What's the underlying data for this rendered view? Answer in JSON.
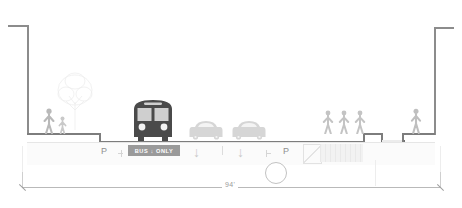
{
  "diagram": {
    "overall_dimension_label": "94'",
    "units": "feet"
  },
  "markings": {
    "parking_left_label": "P",
    "parking_right_label": "P",
    "bus_lane_label": "BUS ↓ ONLY",
    "travel_lane_arrow_1": "↓",
    "travel_lane_arrow_2": "↓"
  },
  "colors": {
    "bus_body": "#4a4a4a",
    "bus_lane_band": "#9a9a9a",
    "car_body": "#d6d6d6",
    "ground_line": "#7d7d7d",
    "building_line": "#8c8c8c",
    "figure_fill": "#bfbfbf",
    "dimension_line": "#b9b9b9",
    "background": "#ffffff"
  },
  "elements": {
    "building_left": "building-wall-left",
    "building_right": "building-wall-right",
    "sidewalk_left": "sidewalk-left",
    "sidewalk_right": "sidewalk-right",
    "parking_lane_left": "parking-lane-left",
    "bus_lane": "bus-only-lane",
    "travel_lane_1": "travel-lane-1",
    "travel_lane_2": "travel-lane-2",
    "parking_lane_right": "parking-lane-right",
    "plaza": "hatched-plaza-zone",
    "tree_pit": "sunken-tree-pit"
  },
  "figures": {
    "left_adult": "pedestrian-adult",
    "left_child": "pedestrian-child",
    "right_group": [
      "pedestrian-1",
      "pedestrian-2",
      "pedestrian-3"
    ],
    "far_right": "pedestrian-far-right"
  },
  "vehicles": {
    "bus": "transit-bus-front",
    "car_1": "car-front-1",
    "car_2": "car-front-2"
  }
}
